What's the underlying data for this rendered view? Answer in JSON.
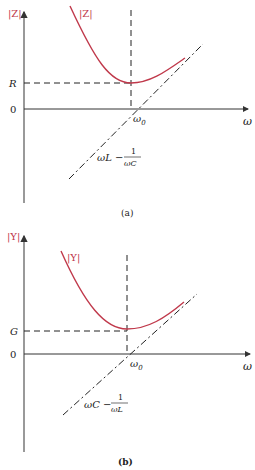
{
  "colors": {
    "curve": "#c0394b",
    "axis": "#444444",
    "dashed": "#222222",
    "ylabel": "#c0394b"
  },
  "panel_a": {
    "y_axis_label": "|Z|",
    "curve_label": "|Z|",
    "level_label": "R",
    "zero_label": "0",
    "resonance_label": "ω",
    "resonance_sub": "0",
    "x_axis_label": "ω",
    "asymptote_label_num_left": "ωL −",
    "asymptote_frac_num": "1",
    "asymptote_frac_den": "ωC",
    "caption": "(a)"
  },
  "panel_b": {
    "y_axis_label": "|Y|",
    "curve_label": "|Y|",
    "level_label": "G",
    "zero_label": "0",
    "resonance_label": "ω",
    "resonance_sub": "0",
    "x_axis_label": "ω",
    "asymptote_label_num_left": "ωC −",
    "asymptote_frac_num": "1",
    "asymptote_frac_den": "ωL",
    "caption": "(b)"
  }
}
